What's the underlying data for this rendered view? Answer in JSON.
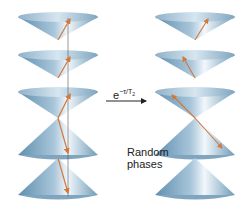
{
  "diagram": {
    "arrow_label": "e",
    "arrow_label_exp": "−τ/T",
    "arrow_label_sub": "2",
    "random_label_line1": "Random",
    "random_label_line2": "phases",
    "colors": {
      "cone": "#6f9bb8",
      "cone_light": "#e8f1f7",
      "spin": "#d2783a",
      "line": "#444444"
    },
    "left_column": {
      "cones": [
        "down",
        "down",
        "down",
        "up",
        "up"
      ],
      "spins_aligned": true
    },
    "right_column": {
      "cones": [
        "down",
        "down",
        "down",
        "up",
        "up"
      ],
      "spins_aligned": false
    }
  }
}
